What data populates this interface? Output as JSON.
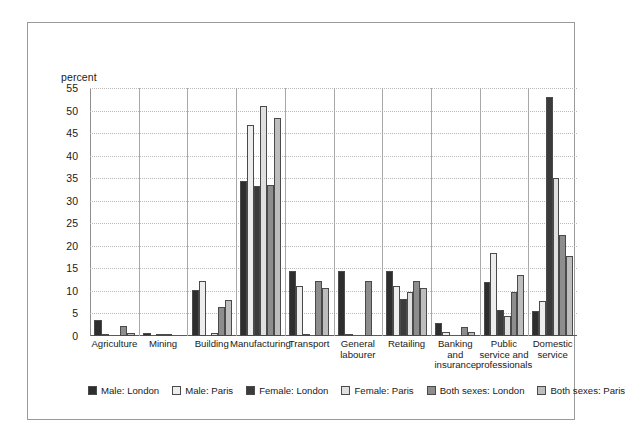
{
  "chart_data": {
    "type": "bar",
    "title": "",
    "subtitle": "",
    "xlabel": "",
    "ylabel": "percent",
    "ylim": [
      0,
      55
    ],
    "ytick_step": 5,
    "yticks": [
      55,
      50,
      45,
      40,
      35,
      30,
      25,
      20,
      15,
      10,
      5,
      0
    ],
    "grid": true,
    "legend_position": "bottom",
    "categories": [
      "Agriculture",
      "Mining",
      "Building",
      "Manufacturing",
      "Transport",
      "General labourer",
      "Retailing",
      "Banking and insurance",
      "Public service and professionals",
      "Domestic service"
    ],
    "category_label_lines": [
      [
        "Agriculture"
      ],
      [
        "Mining"
      ],
      [
        "Building"
      ],
      [
        "Manufacturing"
      ],
      [
        "Transport"
      ],
      [
        "General",
        "labourer"
      ],
      [
        "Retailing"
      ],
      [
        "Banking",
        "and",
        "insurance"
      ],
      [
        "Public",
        "service and",
        "professionals"
      ],
      [
        "Domestic",
        "service"
      ]
    ],
    "series": [
      {
        "name": "Male: London",
        "color": "#2e2e2e",
        "values": [
          3.6,
          0.7,
          10.2,
          34.3,
          14.5,
          14.5,
          14.5,
          2.8,
          12.0,
          5.5
        ]
      },
      {
        "name": "Male: Paris",
        "color": "#ededed",
        "values": [
          0.5,
          0.0,
          12.2,
          46.7,
          11.2,
          0.3,
          11.2,
          1.0,
          18.5,
          7.8
        ]
      },
      {
        "name": "Female: London",
        "color": "#3b3b3b",
        "values": [
          0.0,
          0.5,
          0.0,
          33.2,
          0.4,
          0.0,
          8.3,
          0.0,
          5.7,
          53.0
        ]
      },
      {
        "name": "Female: Paris",
        "color": "#e0e0e0",
        "values": [
          0.0,
          0.2,
          0.6,
          51.0,
          0.0,
          0.0,
          9.8,
          0.0,
          4.5,
          35.0
        ]
      },
      {
        "name": "Both sexes: London",
        "color": "#8d8d8d",
        "values": [
          2.3,
          0.0,
          6.5,
          33.5,
          12.2,
          12.2,
          12.2,
          2.0,
          9.8,
          22.5
        ]
      },
      {
        "name": "Both sexes: Paris",
        "color": "#bdbdbd",
        "values": [
          0.6,
          0.0,
          8.0,
          48.4,
          10.6,
          0.0,
          10.6,
          0.9,
          13.5,
          17.8
        ]
      }
    ]
  },
  "colors": {
    "frame_border": "#9a9a9a",
    "axis": "#5a5a5a",
    "gridline": "#b9b9b9",
    "group_separator": "#a8a8a8",
    "bar_outline": "#4a4a4a",
    "background": "#ffffff",
    "text": "#1a1a1a"
  }
}
